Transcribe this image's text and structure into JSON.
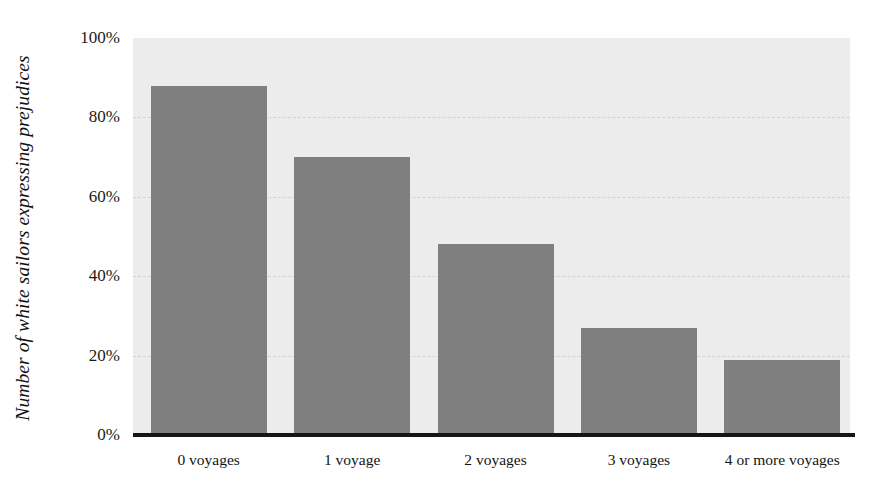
{
  "chart_data": {
    "type": "bar",
    "title": "",
    "subtitle": "",
    "xlabel": "",
    "ylabel": "Number of white sailors expressing prejudices",
    "categories": [
      "0 voyages",
      "1 voyage",
      "2 voyages",
      "3 voyages",
      "4 or more voyages"
    ],
    "values": [
      88,
      70,
      48,
      27,
      19
    ],
    "value_labels": [
      "88%",
      "70%",
      "48%",
      "27%",
      "19%"
    ],
    "ylim": [
      0,
      100
    ],
    "ytick_values": [
      100,
      80,
      60,
      40,
      20,
      0
    ],
    "ytick_labels": [
      "100%",
      "80%",
      "60%",
      "40%",
      "20%",
      "0%"
    ],
    "grid": true,
    "grid_axis": "y",
    "grid_style": "dashed",
    "legend": false,
    "legend_position": "none",
    "orientation": "vertical",
    "bar_color": "#7f7f7f",
    "plot_background": "#ececec",
    "page_background": "#ffffff",
    "axis_line_color": "#161616",
    "gridline_color": "#d2d2d2",
    "text_color": "#141414"
  }
}
